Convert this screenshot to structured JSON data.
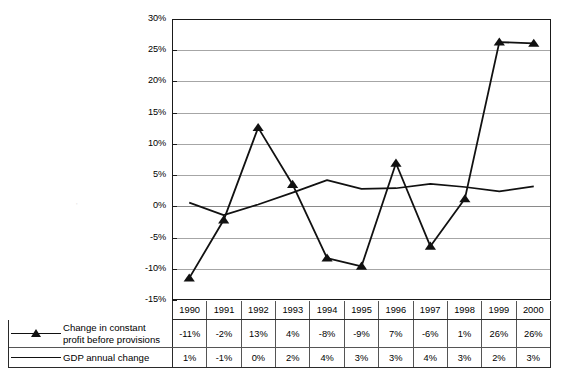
{
  "chart_data": {
    "type": "line",
    "title": "",
    "xlabel": "",
    "ylabel": "",
    "ylim": [
      -15,
      30
    ],
    "ytick_labels": [
      "30%",
      "25%",
      "20%",
      "15%",
      "10%",
      "5%",
      "0%",
      "-5%",
      "-10%",
      "-15%"
    ],
    "ytick_values": [
      30,
      25,
      20,
      15,
      10,
      5,
      0,
      -5,
      -10,
      -15
    ],
    "grid": true,
    "legend_position": "bottom-table",
    "categories": [
      "1990",
      "1991",
      "1992",
      "1993",
      "1994",
      "1995",
      "1996",
      "1997",
      "1998",
      "1999",
      "2000"
    ],
    "series": [
      {
        "name": "Change in constant profit before provisions",
        "marker": "triangle",
        "values": [
          -11,
          -2,
          13,
          4,
          -8,
          -9,
          7,
          -6,
          1,
          26,
          26
        ],
        "labels": [
          "-11%",
          "-2%",
          "13%",
          "4%",
          "-8%",
          "-9%",
          "7%",
          "-6%",
          "1%",
          "26%",
          "26%"
        ],
        "plot_values": [
          -11.5,
          -2.2,
          12.6,
          3.5,
          -8.3,
          -9.6,
          6.9,
          -6.4,
          1.2,
          26.3,
          26.1
        ]
      },
      {
        "name": "GDP annual change",
        "marker": "none",
        "values": [
          1,
          -1,
          0,
          2,
          4,
          3,
          3,
          4,
          3,
          2,
          3
        ],
        "labels": [
          "1%",
          "-1%",
          "0%",
          "2%",
          "4%",
          "3%",
          "3%",
          "4%",
          "3%",
          "2%",
          "3%"
        ],
        "plot_values": [
          0.6,
          -1.4,
          0.3,
          2.2,
          4.2,
          2.8,
          2.9,
          3.6,
          3.1,
          2.4,
          3.2
        ]
      }
    ],
    "colors": {
      "series_line": "#111111",
      "gridline": "#a6a6a6",
      "axis": "#1a1a1a",
      "background": "#ffffff"
    }
  },
  "table": {
    "year_header": [
      "1990",
      "1991",
      "1992",
      "1993",
      "1994",
      "1995",
      "1996",
      "1997",
      "1998",
      "1999",
      "2000"
    ],
    "rows": [
      {
        "legend_label": "Change in constant profit before provisions",
        "key": "triangle-marker-line",
        "values": [
          "-11%",
          "-2%",
          "13%",
          "4%",
          "-8%",
          "-9%",
          "7%",
          "-6%",
          "1%",
          "26%",
          "26%"
        ]
      },
      {
        "legend_label": "GDP annual change",
        "key": "plain-line",
        "values": [
          "1%",
          "-1%",
          "0%",
          "2%",
          "4%",
          "3%",
          "3%",
          "4%",
          "3%",
          "2%",
          "3%"
        ]
      }
    ]
  },
  "artifact": {
    "faint_scan_mark": "'"
  }
}
